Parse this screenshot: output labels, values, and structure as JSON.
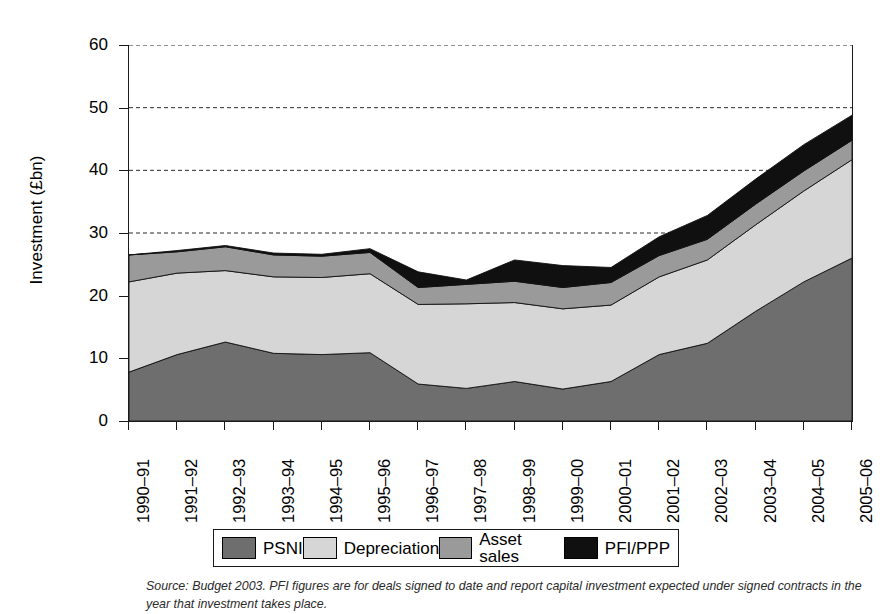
{
  "figure": {
    "ylabel": "Investment (£bn)",
    "source_note": "Source: Budget 2003. PFI figures are for deals signed to date and report capital investment expected under signed contracts in the year that investment takes place."
  },
  "chart_data": {
    "type": "area",
    "stacked": true,
    "title": "",
    "xlabel": "",
    "ylabel": "Investment (£bn)",
    "ylim": [
      0,
      60
    ],
    "yticks": [
      0,
      10,
      20,
      30,
      40,
      50,
      60
    ],
    "grid": true,
    "legend_position": "bottom",
    "categories": [
      "1990–91",
      "1991–92",
      "1992–93",
      "1993–94",
      "1994–95",
      "1995–96",
      "1996–97",
      "1997–98",
      "1998–99",
      "1999–00",
      "2000–01",
      "2001–02",
      "2002–03",
      "2003–04",
      "2004–05",
      "2005–06"
    ],
    "series": [
      {
        "name": "PSNI",
        "color": "#6e6e6e",
        "values": [
          7.8,
          10.6,
          12.6,
          10.8,
          10.6,
          10.9,
          5.9,
          5.2,
          6.3,
          5.1,
          6.3,
          10.6,
          12.4,
          17.5,
          22.2,
          26.0
        ]
      },
      {
        "name": "Depreciation",
        "color": "#d6d6d6",
        "values": [
          14.4,
          13.0,
          11.4,
          12.2,
          12.3,
          12.6,
          12.7,
          13.5,
          12.6,
          12.8,
          12.2,
          12.4,
          13.3,
          13.8,
          14.5,
          15.7
        ]
      },
      {
        "name": "Asset sales",
        "color": "#9a9a9a",
        "values": [
          4.3,
          3.4,
          3.8,
          3.5,
          3.4,
          3.4,
          2.7,
          3.1,
          3.4,
          3.4,
          3.6,
          3.4,
          3.3,
          3.3,
          3.2,
          3.1
        ]
      },
      {
        "name": "PFI/PPP",
        "color": "#101010",
        "values": [
          0.0,
          0.2,
          0.2,
          0.3,
          0.3,
          0.6,
          2.5,
          0.7,
          3.4,
          3.5,
          2.4,
          3.0,
          3.8,
          4.0,
          4.2,
          4.0
        ]
      }
    ],
    "totals": [
      26.5,
      27.2,
      28.0,
      26.8,
      26.6,
      27.5,
      23.8,
      22.5,
      25.7,
      24.8,
      24.5,
      29.4,
      32.8,
      38.6,
      44.1,
      48.8
    ]
  },
  "legend": {
    "items": [
      {
        "label": "PSNI",
        "swatch_name": "legend-swatch-psni"
      },
      {
        "label": "Depreciation",
        "swatch_name": "legend-swatch-depreciation"
      },
      {
        "label": "Asset sales",
        "swatch_name": "legend-swatch-asset-sales"
      },
      {
        "label": "PFI/PPP",
        "swatch_name": "legend-swatch-pfi-ppp"
      }
    ]
  }
}
